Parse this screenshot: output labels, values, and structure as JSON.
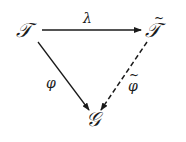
{
  "diagram": {
    "type": "commutative-triangle",
    "nodes": {
      "source": {
        "label": "𝒯",
        "name": "F"
      },
      "target": {
        "label": "𝒯",
        "tilde": "~",
        "name": "F-tilde"
      },
      "bottom": {
        "label": "𝒢",
        "name": "G"
      }
    },
    "arrows": {
      "lambda": {
        "label": "λ",
        "from": "F",
        "to": "F-tilde",
        "style": "solid"
      },
      "phi": {
        "label": "φ",
        "from": "F",
        "to": "G",
        "style": "solid"
      },
      "phi_tilde": {
        "label": "φ",
        "tilde": "~",
        "from": "F-tilde",
        "to": "G",
        "style": "dashed"
      }
    },
    "color": "#1a1a1a"
  }
}
